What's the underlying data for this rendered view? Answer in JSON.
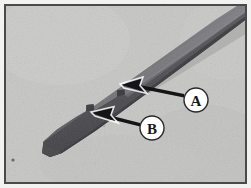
{
  "figure": {
    "kind": "photograph",
    "caption_absent": true,
    "background_color": "#c6c6c4",
    "frame": {
      "outer_margin_color": "#f2f2f0",
      "border_color": "#4a4a4a",
      "border_width_px": 2,
      "margin_px": 4
    },
    "blade": {
      "body_color": "#565658",
      "highlight_color": "#74747a",
      "shadow_color": "#3c3c40",
      "cast_shadow_color": "#a9a9a8",
      "tip_position": "bottom-left",
      "shaft_exit": "top-right-edge"
    },
    "speck": {
      "color": "#6a6a68",
      "note": "small dark fleck on surface near lower-left"
    }
  },
  "annotations": {
    "arrow_color": "#141416",
    "callout_fill": "#ffffff",
    "callout_stroke": "#2a2a2c",
    "items": [
      {
        "id": "callout-a",
        "label": "A",
        "target_feature": "upper notch on blade edge",
        "circle": {
          "cx": 196,
          "cy": 100,
          "r": 12
        },
        "arrow": {
          "tail_x": 184,
          "tail_y": 97,
          "tip_x": 121,
          "tip_y": 85
        }
      },
      {
        "id": "callout-b",
        "label": "B",
        "target_feature": "lower notch on blade edge",
        "circle": {
          "cx": 152,
          "cy": 128,
          "r": 12
        },
        "arrow": {
          "tail_x": 140,
          "tail_y": 126,
          "tip_x": 92,
          "tip_y": 113
        }
      }
    ]
  }
}
